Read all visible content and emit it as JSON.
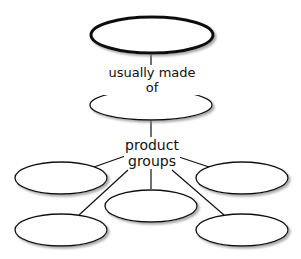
{
  "diagram": {
    "type": "concept-map",
    "root_node": {
      "label": ""
    },
    "link_1": {
      "label": "usually made of"
    },
    "middle_node": {
      "label": ""
    },
    "link_2": {
      "label_line1": "product",
      "label_line2": "groups"
    },
    "leaf_nodes": [
      {
        "label": ""
      },
      {
        "label": ""
      },
      {
        "label": ""
      },
      {
        "label": ""
      },
      {
        "label": ""
      }
    ],
    "colors": {
      "stroke": "#111111",
      "fill": "#ffffff",
      "shadow": "#9a9a9a"
    }
  }
}
